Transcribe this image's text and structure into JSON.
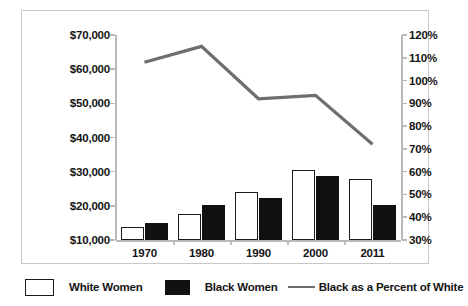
{
  "title": "",
  "chart_data": {
    "type": "bar",
    "title": "",
    "subtitle": "",
    "xlabel": "",
    "ylabel": "",
    "categories": [
      "1970",
      "1980",
      "1990",
      "2000",
      "2011"
    ],
    "series": [
      {
        "name": "White Women",
        "axis": "left",
        "style": "bar-white",
        "values": [
          13800,
          17600,
          24000,
          30600,
          28000
        ]
      },
      {
        "name": "Black Women",
        "axis": "left",
        "style": "bar-black",
        "values": [
          15000,
          20300,
          22400,
          28800,
          20300
        ]
      },
      {
        "name": "Black as a Percent of White",
        "axis": "right",
        "style": "line",
        "values": [
          108,
          115,
          92,
          93.5,
          72
        ]
      }
    ],
    "left_axis": {
      "ylim": [
        10000,
        70000
      ],
      "tick_values": [
        10000,
        20000,
        30000,
        40000,
        50000,
        60000,
        70000
      ],
      "tick_labels": [
        "$10,000",
        "$20,000",
        "$30,000",
        "$40,000",
        "$50,000",
        "$60,000",
        "$70,000"
      ]
    },
    "right_axis": {
      "ylim": [
        30,
        120
      ],
      "tick_values": [
        30,
        40,
        50,
        60,
        70,
        80,
        90,
        100,
        110,
        120
      ],
      "tick_labels": [
        "30%",
        "40%",
        "50%",
        "60%",
        "70%",
        "80%",
        "90%",
        "100%",
        "110%",
        "120%"
      ]
    },
    "grid": false,
    "legend_position": "bottom",
    "colors": {
      "white_bar_fill": "#ffffff",
      "white_bar_stroke": "#1a1a1a",
      "black_bar_fill": "#111111",
      "line": "#6e6e6e",
      "axis": "#b9b9b9",
      "frame": "#c8c8c8",
      "text": "#141414"
    }
  },
  "legend": {
    "items": [
      {
        "label": "White Women",
        "icon": "white-square-swatch"
      },
      {
        "label": "Black Women",
        "icon": "black-square-swatch"
      },
      {
        "label": "Black as a Percent of White",
        "icon": "line-swatch"
      }
    ]
  }
}
